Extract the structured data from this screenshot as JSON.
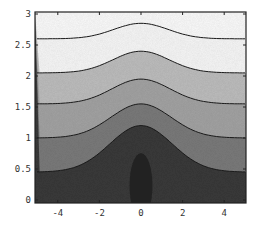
{
  "chart_data": {
    "type": "contour",
    "title": "",
    "xlabel": "",
    "ylabel": "",
    "xlim": [
      -5,
      5
    ],
    "ylim": [
      0,
      3
    ],
    "x_ticks": [
      -4,
      -2,
      0,
      2,
      4
    ],
    "x_tick_labels": [
      "-4",
      "-2",
      "0",
      "2",
      "4"
    ],
    "y_ticks": [
      0,
      0.5,
      1,
      1.5,
      2,
      2.5,
      3
    ],
    "y_tick_labels": [
      "0",
      "0.5",
      "1",
      "1.5",
      "2",
      "2.5",
      "3"
    ],
    "grid": false,
    "legend": null,
    "shading": "grayscale, darker = lower value",
    "contours": [
      {
        "level": 1,
        "edge_y": 2.6,
        "peak_y": 2.85,
        "fill": "#f7f7f7"
      },
      {
        "level": 2,
        "edge_y": 2.05,
        "peak_y": 2.4,
        "fill": "#bdbdbd"
      },
      {
        "level": 3,
        "edge_y": 1.55,
        "peak_y": 1.95,
        "fill": "#a3a3a3"
      },
      {
        "level": 4,
        "edge_y": 1.0,
        "peak_y": 1.55,
        "fill": "#7a7a7a"
      },
      {
        "level": 5,
        "edge_y": 0.45,
        "peak_y": 1.2,
        "fill": "#555555"
      },
      {
        "level": 6,
        "closed_ellipse": true,
        "center_x": 0,
        "top_y": 0.9,
        "half_width_x": 0.55,
        "fill": "#262626"
      }
    ],
    "bottom_fill": "#3a3a3a"
  }
}
